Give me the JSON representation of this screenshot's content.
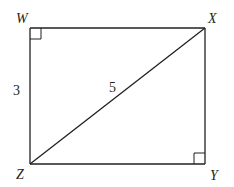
{
  "diagram": {
    "type": "geometry-rectangle",
    "colors": {
      "stroke": "#231f20",
      "background": "#ffffff"
    },
    "vertices": {
      "W": {
        "label": "W",
        "x": 30,
        "y": 28
      },
      "X": {
        "label": "X",
        "x": 205,
        "y": 28
      },
      "Y": {
        "label": "Y",
        "x": 205,
        "y": 164
      },
      "Z": {
        "label": "Z",
        "x": 30,
        "y": 164
      }
    },
    "segments": [
      {
        "from": "W",
        "to": "X"
      },
      {
        "from": "X",
        "to": "Y"
      },
      {
        "from": "Y",
        "to": "Z"
      },
      {
        "from": "Z",
        "to": "W"
      },
      {
        "from": "Z",
        "to": "X",
        "kind": "diagonal"
      }
    ],
    "right_angle_marks": [
      "W",
      "Y"
    ],
    "measurements": {
      "WZ": "3",
      "ZX": "5"
    }
  }
}
